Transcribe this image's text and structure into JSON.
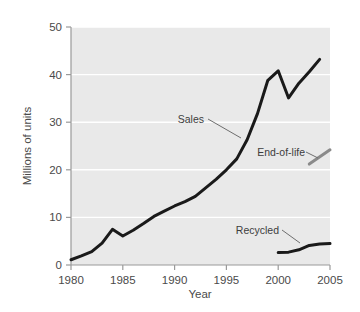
{
  "chart_data": {
    "type": "line",
    "title": "",
    "xlabel": "Year",
    "ylabel": "Millions of units",
    "xlim": [
      1980,
      2005
    ],
    "ylim": [
      0,
      50
    ],
    "xticks": [
      1980,
      1985,
      1990,
      1995,
      2000,
      2005
    ],
    "yticks": [
      0,
      10,
      20,
      30,
      40,
      50
    ],
    "grid": true,
    "legend_position": "inline-annotations",
    "background": "#e9e9e9",
    "gridline_color": "#ffffff",
    "series": [
      {
        "name": "Sales",
        "color": "#1a1a1a",
        "x": [
          1980,
          1981,
          1982,
          1983,
          1984,
          1985,
          1986,
          1987,
          1988,
          1989,
          1990,
          1991,
          1992,
          1993,
          1994,
          1995,
          1996,
          1997,
          1998,
          1999,
          2000,
          2001,
          2002,
          2003,
          2004
        ],
        "values": [
          1.1,
          1.9,
          2.8,
          4.6,
          7.5,
          6.1,
          7.3,
          8.7,
          10.2,
          11.3,
          12.4,
          13.3,
          14.4,
          16.2,
          18.0,
          20.0,
          22.3,
          26.3,
          31.8,
          38.8,
          40.8,
          35.1,
          38.2,
          40.6,
          43.2
        ]
      },
      {
        "name": "End-of-life",
        "color": "#8a8a8a",
        "x": [
          2003,
          2005
        ],
        "values": [
          21.2,
          24.2
        ]
      },
      {
        "name": "Recycled",
        "color": "#1a1a1a",
        "x": [
          2000,
          2001,
          2002,
          2003,
          2004,
          2005
        ],
        "values": [
          2.6,
          2.7,
          3.2,
          4.1,
          4.4,
          4.5
        ]
      }
    ],
    "annotations": [
      {
        "text": "Sales",
        "target_series": "Sales",
        "label_x": 204,
        "label_y": 123,
        "leader_from_x": 208,
        "leader_from_y": 119,
        "leader_to_x": 241,
        "leader_to_y": 138
      },
      {
        "text": "End-of-life",
        "target_series": "End-of-life",
        "label_x": 305,
        "label_y": 156,
        "leader_from_x": 306,
        "leader_from_y": 152,
        "leader_to_x": 318,
        "leader_to_y": 158
      },
      {
        "text": "Recycled",
        "target_series": "Recycled",
        "label_x": 279,
        "label_y": 234,
        "leader_from_x": 282,
        "leader_from_y": 230,
        "leader_to_x": 300,
        "leader_to_y": 243
      }
    ]
  },
  "axes": {
    "y_tick_labels": [
      "50",
      "40",
      "30",
      "20",
      "10",
      "0"
    ],
    "x_tick_labels": [
      "1980",
      "1985",
      "1990",
      "1995",
      "2000",
      "2005"
    ],
    "x_axis_title": "Year",
    "y_axis_title": "Millions of units"
  },
  "labels": {
    "sales": "Sales",
    "end_of_life": "End-of-life",
    "recycled": "Recycled"
  }
}
